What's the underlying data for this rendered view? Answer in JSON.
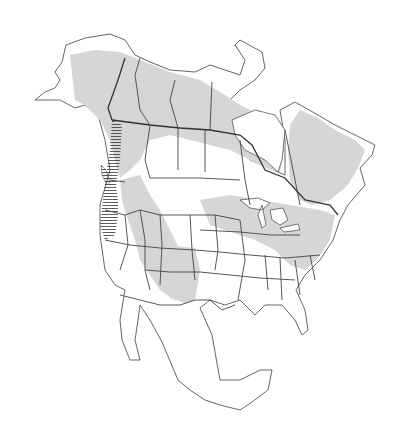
{
  "map": {
    "type": "species-range-map",
    "region": "North America",
    "colors": {
      "background": "#ffffff",
      "land": "#ffffff",
      "outline": "#555555",
      "range_shading": "#d6d6d6",
      "hatching": "#333333"
    },
    "legend": [],
    "labels": [],
    "layers": [
      {
        "name": "range-shaded",
        "description": "Gray shaded range across Alaska, Canada, northern and western US"
      },
      {
        "name": "range-hatched",
        "description": "Horizontal hatching along Pacific coast from British Columbia to California"
      }
    ]
  }
}
